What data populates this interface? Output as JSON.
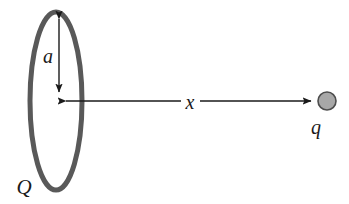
{
  "figure": {
    "background_color": "#ffffff",
    "width": 349,
    "height": 204
  },
  "colors": {
    "ring_stroke": "#595959",
    "arrow_stroke": "#1a1a1a",
    "label_text": "#1a1a1a",
    "charge_fill": "#a8a8a8",
    "charge_stroke": "#4d4d4d",
    "background": "#ffffff"
  },
  "labels": {
    "ring_charge": "Q",
    "ring_radius": "a",
    "axis_distance": "x",
    "point_charge": "q"
  },
  "geometry": {
    "ring": {
      "cx": 56,
      "cy": 101,
      "rx": 26,
      "ry": 89,
      "stroke_width": 5
    },
    "radius_arrow": {
      "x": 59,
      "y_top": 14,
      "y_bottom": 97,
      "double_headed": true
    },
    "axis_arrow": {
      "y": 101,
      "x_left": 60,
      "x_right": 317,
      "gap_start": 181,
      "gap_end": 200
    },
    "point_charge": {
      "cx": 327,
      "cy": 101,
      "r": 9
    },
    "label_positions": {
      "ring_charge": {
        "x": 16,
        "y": 194
      },
      "ring_radius": {
        "x": 48,
        "y": 63
      },
      "axis_distance": {
        "x": 184,
        "y": 109
      },
      "point_charge": {
        "x": 310,
        "y": 134
      }
    }
  }
}
